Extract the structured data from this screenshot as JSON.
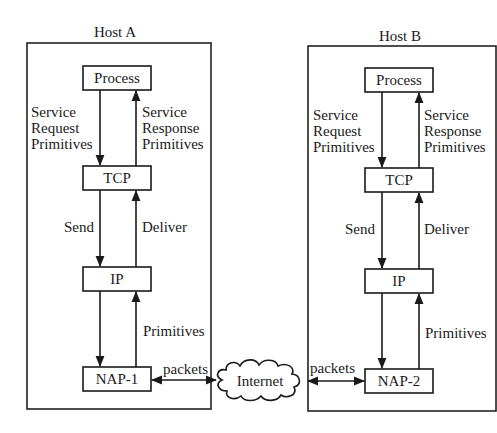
{
  "diagram": {
    "hosts": [
      {
        "title": "Host A",
        "layers": [
          "Process",
          "TCP",
          "IP",
          "NAP-1"
        ],
        "labels": {
          "down_1": [
            "Service",
            "Request",
            "Primitives"
          ],
          "up_1": [
            "Service",
            "Response",
            "Primitives"
          ],
          "down_2": "Send",
          "up_2": "Deliver",
          "up_3": "Primitives"
        },
        "link_label": "packets"
      },
      {
        "title": "Host B",
        "layers": [
          "Process",
          "TCP",
          "IP",
          "NAP-2"
        ],
        "labels": {
          "down_1": [
            "Service",
            "Request",
            "Primitives"
          ],
          "up_1": [
            "Service",
            "Response",
            "Primitives"
          ],
          "down_2": "Send",
          "up_2": "Deliver",
          "up_3": "Primitives"
        },
        "link_label": "packets"
      }
    ],
    "network": "Internet"
  }
}
